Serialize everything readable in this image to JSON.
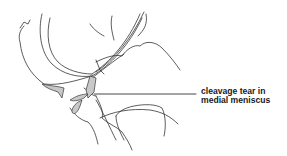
{
  "diagram": {
    "annotation": {
      "line1": "cleavage tear in",
      "line2": "medial meniscus"
    },
    "colors": {
      "stroke": "#333333",
      "meniscus_fill": "#c8c8c8",
      "background": "#ffffff"
    }
  }
}
